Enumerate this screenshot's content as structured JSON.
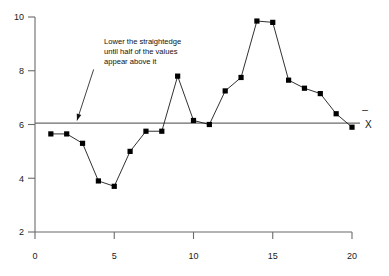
{
  "chart_data": {
    "type": "line",
    "title": "",
    "subtitle": "",
    "xlabel": "",
    "ylabel": "",
    "xlim": [
      0,
      20
    ],
    "ylim": [
      2,
      10
    ],
    "grid": false,
    "legend": null,
    "x": [
      1,
      2,
      3,
      4,
      5,
      6,
      7,
      8,
      9,
      10,
      11,
      12,
      13,
      14,
      15,
      16,
      17,
      18,
      19,
      20
    ],
    "values": [
      5.65,
      5.65,
      5.3,
      3.9,
      3.7,
      5.0,
      5.75,
      5.75,
      7.8,
      6.15,
      6.0,
      7.25,
      7.75,
      9.85,
      9.8,
      7.65,
      7.35,
      7.15,
      6.4,
      5.9
    ],
    "series": [
      {
        "name": "measurements",
        "values": [
          5.65,
          5.65,
          5.3,
          3.9,
          3.7,
          5.0,
          5.75,
          5.75,
          7.8,
          6.15,
          6.0,
          7.25,
          7.75,
          9.85,
          9.8,
          7.65,
          7.35,
          7.15,
          6.4,
          5.9
        ],
        "marker": "square",
        "marker_color": "#000000",
        "line_color": "#1a1a1a"
      }
    ],
    "xticks": [
      0,
      5,
      10,
      15,
      20
    ],
    "xtick_labels": [
      "0",
      "5",
      "10",
      "15",
      "20"
    ],
    "yticks": [
      2,
      4,
      6,
      8,
      10
    ],
    "ytick_labels": [
      "2",
      "4",
      "6",
      "8",
      "10"
    ],
    "reference_line": {
      "name": "mean-line",
      "orientation": "horizontal",
      "value": 6.05,
      "label": "X",
      "label_overbar": "̅",
      "color": "#6b6b6b"
    },
    "annotations": [
      {
        "name": "straightedge-note",
        "lines": [
          "Lower the straightedge",
          "until half of the values",
          "appear above it"
        ],
        "arrow_from": [
          3.7,
          8.05
        ],
        "arrow_to": [
          2.65,
          6.15
        ]
      }
    ]
  },
  "axes": {
    "axis_color": "#6b6b6b",
    "tick_color": "#6b6b6b"
  }
}
